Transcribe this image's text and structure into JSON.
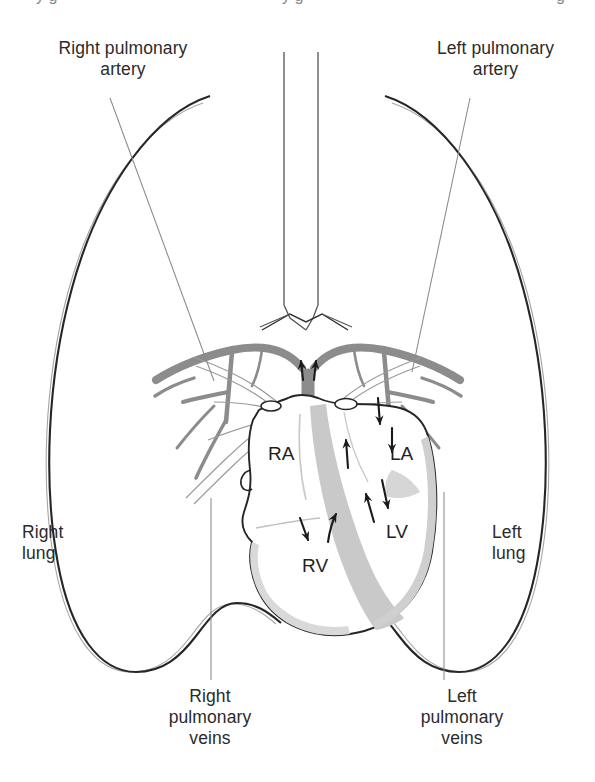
{
  "figure": {
    "type": "anatomical-line-diagram",
    "background_color": "#ffffff",
    "colors": {
      "outline": "#262626",
      "pleura_line": "#9a9a9a",
      "artery_gray": "#8c8c8c",
      "vein_outline": "#9a9a9a",
      "septum_gray": "#c9c9c9",
      "myocardium_gray": "#d6d6d6",
      "text": "#2b2b2b",
      "leader_line": "#8a8a8a"
    }
  },
  "labels": {
    "right_pulmonary_artery": "Right pulmonary\nartery",
    "left_pulmonary_artery": "Left pulmonary\nartery",
    "right_lung": "Right\nlung",
    "left_lung": "Left\nlung",
    "right_pulmonary_veins": "Right\npulmonary\nveins",
    "left_pulmonary_veins": "Left\npulmonary\nveins"
  },
  "chambers": {
    "right_atrium": "RA",
    "left_atrium": "LA",
    "right_ventricle": "RV",
    "left_ventricle": "LV"
  },
  "cropped_top_text": {
    "left_fragment": "y g",
    "center_fragment": "y g",
    "right_fragment": "g"
  },
  "flow_arrows": [
    {
      "name": "pulmonary-trunk-up-left",
      "direction": "up",
      "x": 303,
      "y": 368
    },
    {
      "name": "pulmonary-trunk-up-right",
      "direction": "up",
      "x": 313,
      "y": 368
    },
    {
      "name": "la-inflow-upper",
      "direction": "down",
      "x": 378,
      "y": 410
    },
    {
      "name": "la-inflow-lower",
      "direction": "down",
      "x": 393,
      "y": 436
    },
    {
      "name": "la-to-lv",
      "direction": "down",
      "x": 385,
      "y": 496
    },
    {
      "name": "lv-outflow",
      "direction": "up",
      "x": 370,
      "y": 508
    },
    {
      "name": "ra-to-rv",
      "direction": "down",
      "x": 305,
      "y": 528
    },
    {
      "name": "rv-outflow",
      "direction": "up",
      "x": 333,
      "y": 520
    },
    {
      "name": "ra-inflow",
      "direction": "up",
      "x": 347,
      "y": 450
    }
  ]
}
